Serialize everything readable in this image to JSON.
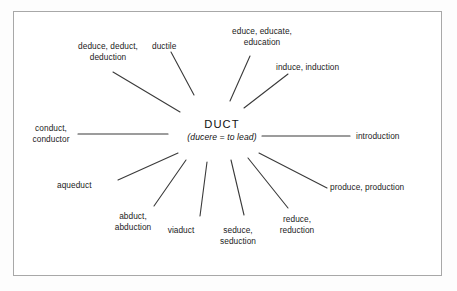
{
  "diagram": {
    "type": "word-web",
    "frame_color": "#a8a8a8",
    "text_color": "#1b1b1b",
    "line_color": "#3a3a3a",
    "background": "#ffffff",
    "center": {
      "root": "DUCT",
      "gloss": "(ducere = to lead)"
    },
    "nodes": [
      {
        "id": "deduce",
        "label": "deduce, deduct,\ndeduction",
        "align": "ctr",
        "x": 108,
        "y": 41
      },
      {
        "id": "ductile",
        "label": "ductile",
        "align": "lft",
        "x": 152,
        "y": 41
      },
      {
        "id": "educe",
        "label": "educe, educate,\neducation",
        "align": "ctr",
        "x": 262,
        "y": 26
      },
      {
        "id": "induce",
        "label": "induce, induction",
        "align": "lft",
        "x": 276,
        "y": 62
      },
      {
        "id": "introduction",
        "label": "introduction",
        "align": "lft",
        "x": 356,
        "y": 131
      },
      {
        "id": "produce",
        "label": "produce, production",
        "align": "lft",
        "x": 330,
        "y": 182
      },
      {
        "id": "reduce",
        "label": "reduce,\nreduction",
        "align": "ctr",
        "x": 297,
        "y": 214
      },
      {
        "id": "seduce",
        "label": "seduce,\nseduction",
        "align": "ctr",
        "x": 238,
        "y": 225
      },
      {
        "id": "viaduct",
        "label": "viaduct",
        "align": "ctr",
        "x": 181,
        "y": 225
      },
      {
        "id": "abduct",
        "label": "abduct,\nabduction",
        "align": "ctr",
        "x": 133,
        "y": 211
      },
      {
        "id": "aqueduct",
        "label": "aqueduct",
        "align": "lft",
        "x": 57,
        "y": 180
      },
      {
        "id": "conduct",
        "label": "conduct,\nconductor",
        "align": "ctr",
        "x": 51,
        "y": 123
      }
    ],
    "spokes": [
      {
        "id": "spoke-deduce",
        "x1": 113,
        "y1": 72,
        "x2": 180,
        "y2": 112
      },
      {
        "id": "spoke-ductile",
        "x1": 171,
        "y1": 52,
        "x2": 194,
        "y2": 95
      },
      {
        "id": "spoke-educe",
        "x1": 250,
        "y1": 56,
        "x2": 230,
        "y2": 101
      },
      {
        "id": "spoke-induce",
        "x1": 288,
        "y1": 74,
        "x2": 244,
        "y2": 108
      },
      {
        "id": "spoke-introduction",
        "x1": 262,
        "y1": 136,
        "x2": 350,
        "y2": 136
      },
      {
        "id": "spoke-produce",
        "x1": 259,
        "y1": 153,
        "x2": 327,
        "y2": 188
      },
      {
        "id": "spoke-reduce",
        "x1": 248,
        "y1": 158,
        "x2": 288,
        "y2": 208
      },
      {
        "id": "spoke-seduce",
        "x1": 231,
        "y1": 160,
        "x2": 244,
        "y2": 215
      },
      {
        "id": "spoke-viaduct",
        "x1": 207,
        "y1": 162,
        "x2": 200,
        "y2": 216
      },
      {
        "id": "spoke-abduct",
        "x1": 186,
        "y1": 160,
        "x2": 154,
        "y2": 206
      },
      {
        "id": "spoke-aqueduct",
        "x1": 178,
        "y1": 153,
        "x2": 118,
        "y2": 180
      },
      {
        "id": "spoke-conduct",
        "x1": 78,
        "y1": 134,
        "x2": 168,
        "y2": 134
      }
    ]
  }
}
